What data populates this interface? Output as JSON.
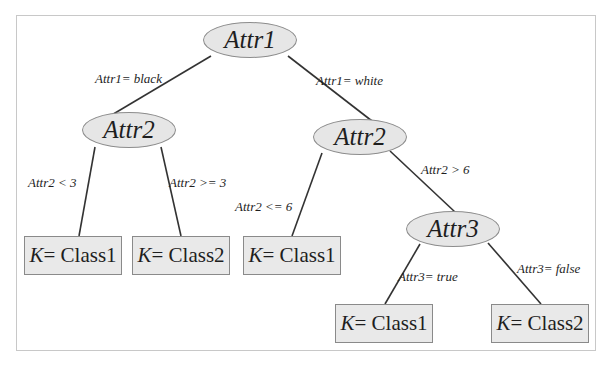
{
  "diagram": {
    "type": "decision-tree",
    "colors": {
      "node_fill": "#e6e6e6",
      "leaf_fill": "#e9e9e9",
      "node_border": "#8c8c8c",
      "edge": "#333333",
      "text": "#1e1e1e",
      "frame_border": "#c8c8c8"
    },
    "nodes": {
      "root": {
        "label": "Attr1"
      },
      "left_attr2": {
        "label": "Attr2"
      },
      "right_attr2": {
        "label": "Attr2"
      },
      "attr3": {
        "label": "Attr3"
      }
    },
    "leaves": [
      {
        "k": "K",
        "eq": "= Class1"
      },
      {
        "k": "K",
        "eq": "= Class2"
      },
      {
        "k": "K",
        "eq": "= Class1"
      },
      {
        "k": "K",
        "eq": "= Class1"
      },
      {
        "k": "K",
        "eq": "= Class2"
      }
    ],
    "edges": {
      "root_left": "Attr1= black",
      "root_right": "Attr1= white",
      "left_lt3": "Attr2 < 3",
      "left_ge3": "Attr2 >= 3",
      "right_le6": "Attr2 <= 6",
      "right_gt6": "Attr2 > 6",
      "attr3_true": "Attr3= true",
      "attr3_false": "Attr3= false"
    }
  }
}
